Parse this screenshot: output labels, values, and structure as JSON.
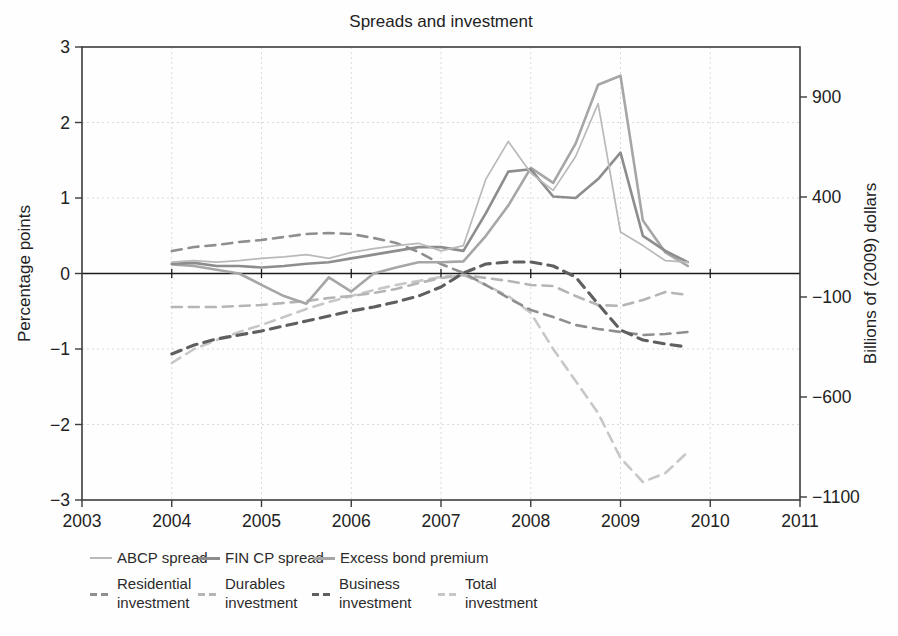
{
  "title": "Spreads and investment",
  "axes": {
    "left": {
      "label": "Percentage points",
      "tick_values": [
        3,
        2,
        1,
        0,
        -1,
        -2,
        -3
      ],
      "tick_labels": [
        "3",
        "2",
        "1",
        "0",
        "−1",
        "−2",
        "−3"
      ],
      "range": [
        -3,
        3
      ]
    },
    "right": {
      "label": "Billions of (2009) dollars",
      "tick_values": [
        900,
        400,
        -100,
        -600,
        -1100
      ],
      "tick_labels": [
        "900",
        "400",
        "−100",
        "−600",
        "−1100"
      ],
      "range": [
        -1115,
        1150
      ]
    },
    "bottom": {
      "tick_values": [
        2003,
        2004,
        2005,
        2006,
        2007,
        2008,
        2009,
        2010,
        2011
      ],
      "tick_labels": [
        "2003",
        "2004",
        "2005",
        "2006",
        "2007",
        "2008",
        "2009",
        "2010",
        "2011"
      ],
      "range": [
        2003,
        2011
      ]
    }
  },
  "chart_data": {
    "type": "line",
    "title": "Spreads and investment",
    "xlabel": "",
    "ylabel_left": "Percentage points",
    "ylabel_right": "Billions of (2009) dollars",
    "legend_position": "bottom",
    "grid": {
      "style": "dotted",
      "vertical_years": [
        2004,
        2005,
        2006,
        2007,
        2008,
        2009,
        2010
      ],
      "horizontal_values": [
        2,
        1,
        -1,
        -2
      ],
      "zero_line": true
    },
    "x": [
      2004.0,
      2004.25,
      2004.5,
      2004.75,
      2005.0,
      2005.25,
      2005.5,
      2005.75,
      2006.0,
      2006.25,
      2006.5,
      2006.75,
      2007.0,
      2007.25,
      2007.5,
      2007.75,
      2008.0,
      2008.25,
      2008.5,
      2008.75,
      2009.0,
      2009.25,
      2009.5,
      2009.75
    ],
    "draw_order": [
      "total",
      "durables",
      "residential",
      "business",
      "ebp",
      "fincp",
      "abcp"
    ],
    "series": [
      {
        "key": "abcp",
        "name": "ABCP spread",
        "axis": "left",
        "unit": "percentage points",
        "line": "solid",
        "color": "#b9b9b9",
        "width": 1.7,
        "values": [
          0.15,
          0.17,
          0.15,
          0.17,
          0.2,
          0.22,
          0.25,
          0.2,
          0.28,
          0.33,
          0.37,
          0.4,
          0.3,
          0.37,
          1.25,
          1.75,
          1.33,
          1.1,
          1.55,
          2.25,
          0.55,
          0.37,
          0.17,
          0.15
        ]
      },
      {
        "key": "fincp",
        "name": "FIN CP spread",
        "axis": "left",
        "unit": "percentage points",
        "line": "solid",
        "color": "#8d8d8d",
        "width": 2.6,
        "values": [
          0.13,
          0.14,
          0.1,
          0.1,
          0.08,
          0.1,
          0.13,
          0.15,
          0.2,
          0.25,
          0.3,
          0.35,
          0.35,
          0.3,
          0.8,
          1.35,
          1.38,
          1.02,
          1.0,
          1.25,
          1.6,
          0.5,
          0.3,
          0.15
        ]
      },
      {
        "key": "ebp",
        "name": "Excess bond premium",
        "axis": "left",
        "unit": "percentage points",
        "line": "solid",
        "color": "#a6a6a6",
        "width": 2.6,
        "values": [
          0.12,
          0.1,
          0.05,
          0.0,
          -0.15,
          -0.3,
          -0.4,
          -0.05,
          -0.24,
          0.0,
          0.08,
          0.15,
          0.15,
          0.16,
          0.5,
          0.9,
          1.4,
          1.2,
          1.72,
          2.5,
          2.62,
          0.7,
          0.28,
          0.1
        ]
      },
      {
        "key": "residential",
        "name": "Residential investment",
        "axis": "right",
        "unit": "billions of (2009) dollars",
        "line": "dashed",
        "color": "#8f8f8f",
        "width": 2.6,
        "values": [
          130,
          150,
          160,
          175,
          185,
          200,
          215,
          220,
          215,
          195,
          170,
          125,
          65,
          20,
          -40,
          -105,
          -165,
          -200,
          -240,
          -260,
          -275,
          -290,
          -285,
          -275
        ]
      },
      {
        "key": "durables",
        "name": "Durables investment",
        "axis": "right",
        "unit": "billions of (2009) dollars",
        "line": "dashed",
        "color": "#b5b5b5",
        "width": 2.6,
        "values": [
          -150,
          -150,
          -150,
          -145,
          -140,
          -130,
          -120,
          -105,
          -95,
          -80,
          -60,
          -30,
          -5,
          10,
          -5,
          -20,
          -40,
          -45,
          -95,
          -140,
          -145,
          -115,
          -75,
          -90
        ]
      },
      {
        "key": "business",
        "name": "Business investment",
        "axis": "right",
        "unit": "billions of (2009) dollars",
        "line": "dashed",
        "color": "#5f5f5f",
        "width": 3.1,
        "values": [
          -385,
          -340,
          -310,
          -290,
          -270,
          -245,
          -220,
          -195,
          -170,
          -150,
          -125,
          -95,
          -50,
          20,
          65,
          75,
          75,
          55,
          0,
          -135,
          -265,
          -315,
          -335,
          -350
        ]
      },
      {
        "key": "total",
        "name": "Total investment",
        "axis": "right",
        "unit": "billions of (2009) dollars",
        "line": "dashed",
        "color": "#c7c7c7",
        "width": 2.6,
        "values": [
          -430,
          -360,
          -315,
          -275,
          -240,
          -200,
          -160,
          -125,
          -95,
          -65,
          -40,
          -20,
          0,
          10,
          -40,
          -95,
          -180,
          -360,
          -520,
          -680,
          -905,
          -1025,
          -980,
          -875
        ]
      }
    ]
  },
  "legend": {
    "items": [
      {
        "label": "ABCP spread",
        "series": "abcp"
      },
      {
        "label": "FIN CP spread",
        "series": "fincp"
      },
      {
        "label": "Excess bond premium",
        "series": "ebp"
      },
      {
        "label": "Residential investment",
        "series": "residential"
      },
      {
        "label": "Durables investment",
        "series": "durables"
      },
      {
        "label": "Business investment",
        "series": "business"
      },
      {
        "label": "Total investment",
        "series": "total"
      }
    ]
  }
}
